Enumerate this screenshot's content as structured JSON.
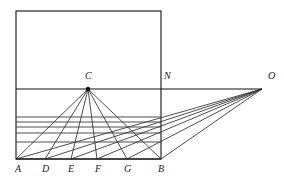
{
  "figure": {
    "stroke_color": "#3a3a3a",
    "accent_color": "#111111",
    "background": "#ffffff",
    "line_width": 0.9
  },
  "canvas": {
    "width": 284,
    "height": 180
  },
  "geometry": {
    "picture_plane_rect": {
      "x1": 16,
      "y1": 11,
      "x2": 161,
      "y2": 159
    },
    "horizon_line": {
      "x1": 16,
      "y1": 89,
      "x2": 262,
      "y2": 89
    },
    "ground_line": {
      "x1": 16,
      "y1": 159,
      "x2": 161,
      "y2": 159
    },
    "transversal_lines_y": [
      117,
      122,
      127,
      133,
      142
    ],
    "transversal_left_x": 16,
    "transversal_right_x": 161
  },
  "points": [
    {
      "id": "A",
      "label": "A",
      "x": 16,
      "y": 159,
      "label_x": 15,
      "label_y": 164
    },
    {
      "id": "D",
      "label": "D",
      "x": 45,
      "y": 159,
      "label_x": 42,
      "label_y": 164
    },
    {
      "id": "E",
      "label": "E",
      "x": 71,
      "y": 159,
      "label_x": 68,
      "label_y": 164
    },
    {
      "id": "F",
      "label": "F",
      "x": 97,
      "y": 159,
      "label_x": 95,
      "label_y": 164
    },
    {
      "id": "G",
      "label": "G",
      "x": 127,
      "y": 159,
      "label_x": 124,
      "label_y": 164
    },
    {
      "id": "B",
      "label": "B",
      "x": 161,
      "y": 159,
      "label_x": 158,
      "label_y": 164
    },
    {
      "id": "C",
      "label": "C",
      "x": 88,
      "y": 89,
      "label_x": 85,
      "label_y": 71
    },
    {
      "id": "N",
      "label": "N",
      "x": 161,
      "y": 89,
      "label_x": 164,
      "label_y": 71
    },
    {
      "id": "O",
      "label": "O",
      "x": 262,
      "y": 89,
      "label_x": 268,
      "label_y": 71
    }
  ],
  "rays": {
    "from_C": [
      "A",
      "D",
      "E",
      "F",
      "G",
      "B"
    ],
    "from_O": [
      "A",
      "D",
      "E",
      "F",
      "G",
      "B"
    ]
  },
  "vertex_dot": {
    "point": "C",
    "radius": 2.2
  }
}
